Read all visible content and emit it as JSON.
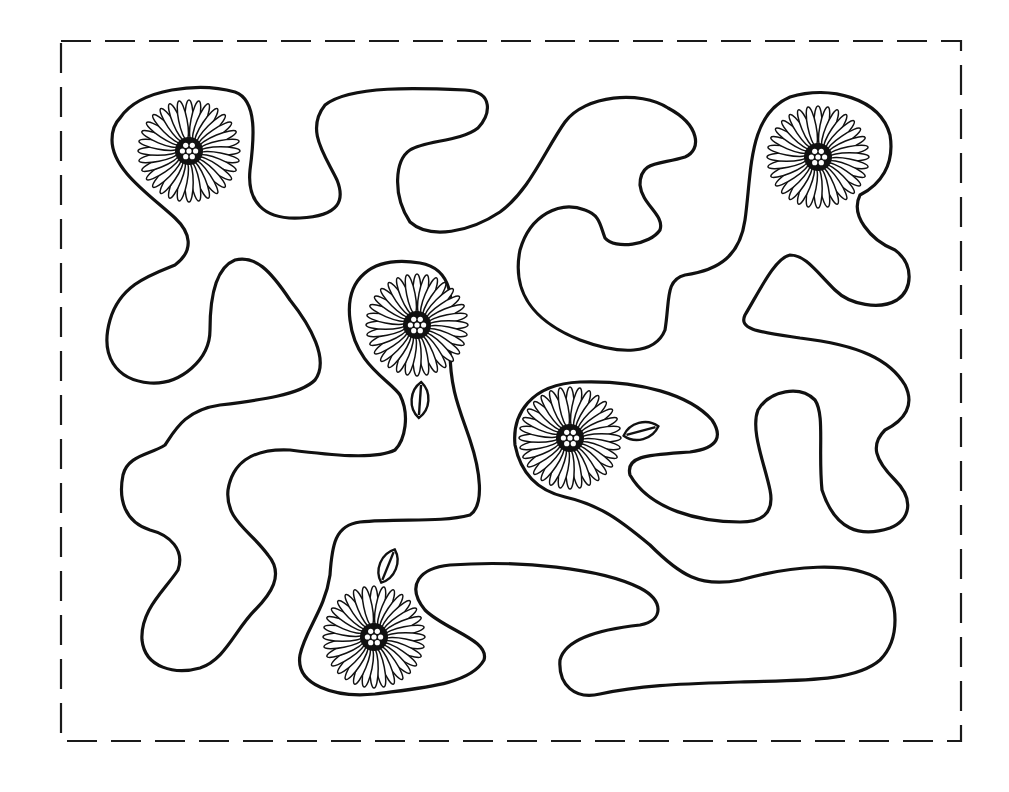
{
  "colors": {
    "line": "#111111",
    "background": "#ffffff"
  },
  "frame": {
    "x": 61,
    "y": 41,
    "width": 900,
    "height": 700,
    "style": "dashed"
  },
  "flowers": [
    {
      "id": "flower-top-left",
      "cx": 189,
      "cy": 151,
      "r": 51,
      "petals": 32
    },
    {
      "id": "flower-top-right",
      "cx": 818,
      "cy": 157,
      "r": 51,
      "petals": 32
    },
    {
      "id": "flower-center",
      "cx": 417,
      "cy": 325,
      "r": 51,
      "petals": 32
    },
    {
      "id": "flower-right-middle",
      "cx": 570,
      "cy": 438,
      "r": 51,
      "petals": 32
    },
    {
      "id": "flower-bottom",
      "cx": 374,
      "cy": 637,
      "r": 51,
      "petals": 32
    }
  ],
  "seeds": [
    {
      "id": "seed-center",
      "cx": 420,
      "cy": 400,
      "rx": 8,
      "ry": 18,
      "rotate": 4
    },
    {
      "id": "seed-right",
      "cx": 641,
      "cy": 431,
      "rx": 8,
      "ry": 18,
      "rotate": 75
    },
    {
      "id": "seed-bottom",
      "cx": 388,
      "cy": 566,
      "rx": 8,
      "ry": 18,
      "rotate": 22
    }
  ]
}
